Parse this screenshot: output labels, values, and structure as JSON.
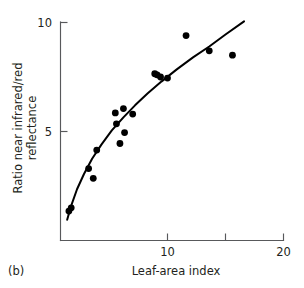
{
  "figure": {
    "panel_label": "(b)",
    "background_color": "#ffffff",
    "ink_color": "#000000",
    "axis_color": "#58595b"
  },
  "chart_data": {
    "type": "scatter",
    "title": "",
    "subtitle": "",
    "xlabel": "Leaf-area index",
    "ylabel": "Ratio near infrared/red reflectance",
    "ylabel_line1": "Ratio near infrared/red",
    "ylabel_line2": "reflectance",
    "xlim": [
      0,
      20
    ],
    "ylim": [
      0,
      10.3
    ],
    "xticks": [
      10,
      15,
      20
    ],
    "xtick_labels": [
      "10",
      "",
      "20"
    ],
    "yticks": [
      5,
      10
    ],
    "ytick_labels": [
      "5",
      "10"
    ],
    "grid": false,
    "legend": null,
    "points": [
      {
        "x": 1.5,
        "y": 1.35
      },
      {
        "x": 1.7,
        "y": 1.5
      },
      {
        "x": 3.2,
        "y": 3.3
      },
      {
        "x": 3.6,
        "y": 2.85
      },
      {
        "x": 3.9,
        "y": 4.15
      },
      {
        "x": 5.5,
        "y": 5.85
      },
      {
        "x": 5.6,
        "y": 5.35
      },
      {
        "x": 5.9,
        "y": 4.45
      },
      {
        "x": 6.2,
        "y": 6.05
      },
      {
        "x": 6.3,
        "y": 4.95
      },
      {
        "x": 7.0,
        "y": 5.8
      },
      {
        "x": 8.9,
        "y": 7.65
      },
      {
        "x": 9.1,
        "y": 7.6
      },
      {
        "x": 9.4,
        "y": 7.5
      },
      {
        "x": 10.0,
        "y": 7.45
      },
      {
        "x": 11.6,
        "y": 9.4
      },
      {
        "x": 13.6,
        "y": 8.7
      },
      {
        "x": 15.6,
        "y": 8.5
      }
    ],
    "fit_curve": {
      "description": "saturating logarithmic fit",
      "points": [
        {
          "x": 1.35,
          "y": 0.95
        },
        {
          "x": 1.7,
          "y": 1.6
        },
        {
          "x": 2.2,
          "y": 2.35
        },
        {
          "x": 2.8,
          "y": 3.05
        },
        {
          "x": 3.5,
          "y": 3.75
        },
        {
          "x": 4.3,
          "y": 4.4
        },
        {
          "x": 5.2,
          "y": 5.05
        },
        {
          "x": 6.2,
          "y": 5.65
        },
        {
          "x": 7.2,
          "y": 6.2
        },
        {
          "x": 8.3,
          "y": 6.75
        },
        {
          "x": 9.5,
          "y": 7.3
        },
        {
          "x": 10.8,
          "y": 7.85
        },
        {
          "x": 12.2,
          "y": 8.4
        },
        {
          "x": 13.6,
          "y": 8.9
        },
        {
          "x": 15.0,
          "y": 9.45
        },
        {
          "x": 16.6,
          "y": 10.05
        }
      ]
    }
  }
}
